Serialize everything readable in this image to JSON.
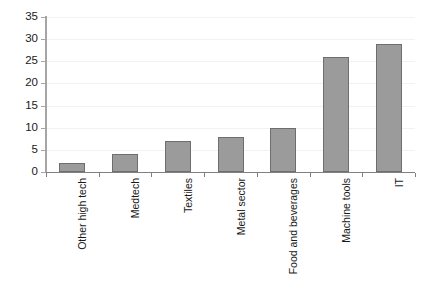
{
  "chart_data": {
    "type": "bar",
    "title": "",
    "subtitle": "",
    "xlabel": "",
    "ylabel": "",
    "categories": [
      "Other high tech",
      "Medtech",
      "Textiles",
      "Metal sector",
      "Food and beverages",
      "Machine tools",
      "IT"
    ],
    "values": [
      2,
      4,
      7,
      8,
      10,
      26,
      29
    ],
    "ylim": [
      0,
      35
    ],
    "ytick_labels": [
      "0",
      "5",
      "10",
      "15",
      "20",
      "25",
      "30",
      "35"
    ],
    "ytick_values": [
      0,
      5,
      10,
      15,
      20,
      25,
      30,
      35
    ],
    "grid": true,
    "legend": false,
    "bar_color": "#9b9b9b",
    "bar_border_color": "#6e6e6e",
    "axis_color": "#808080",
    "gridline_color": "#f2f2f2",
    "background": "#ffffff"
  }
}
